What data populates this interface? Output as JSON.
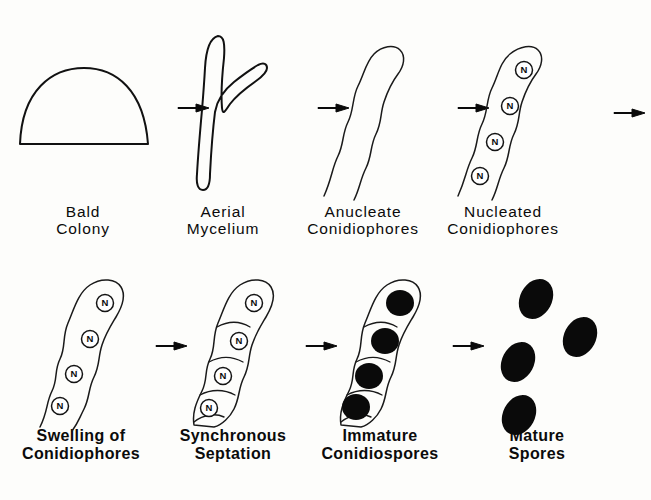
{
  "figure": {
    "background_color": "#fdfdfb",
    "ink_color": "#111111",
    "spore_fill_color": "#0a0a0a",
    "nucleus_label": "N"
  },
  "rows": [
    {
      "id": "row-top",
      "stages": [
        {
          "id": "bald-colony",
          "shape": "dome",
          "caption_lines": [
            "Bald",
            "Colony"
          ],
          "nuclei_count": 0,
          "septa_count": 0,
          "spores_count": 0
        },
        {
          "id": "aerial-mycelium",
          "shape": "branched-hypha",
          "caption_lines": [
            "Aerial",
            "Mycelium"
          ],
          "nuclei_count": 0,
          "septa_count": 0,
          "spores_count": 0
        },
        {
          "id": "anucleate-conidiophores",
          "shape": "wavy-tube",
          "caption_lines": [
            "Anucleate",
            "Conidiophores"
          ],
          "nuclei_count": 0,
          "septa_count": 0,
          "spores_count": 0
        },
        {
          "id": "nucleated-conidiophores",
          "shape": "wavy-tube-nuclei",
          "caption_lines": [
            "Nucleated",
            "Conidiophores"
          ],
          "nuclei_count": 4,
          "septa_count": 0,
          "spores_count": 0
        }
      ]
    },
    {
      "id": "row-bottom",
      "stages": [
        {
          "id": "swelling-of-conidiophores",
          "shape": "swollen-tube-nuclei",
          "caption_lines": [
            "Swelling of",
            "Conidiophores"
          ],
          "nuclei_count": 4,
          "septa_count": 0,
          "spores_count": 0
        },
        {
          "id": "synchronous-septation",
          "shape": "septate-tube-nuclei",
          "caption_lines": [
            "Synchronous",
            "Septation"
          ],
          "nuclei_count": 4,
          "septa_count": 4,
          "spores_count": 0
        },
        {
          "id": "immature-conidiospores",
          "shape": "septate-tube-spores",
          "caption_lines": [
            "Immature",
            "Conidiospores"
          ],
          "nuclei_count": 0,
          "septa_count": 4,
          "spores_count": 4
        },
        {
          "id": "mature-spores",
          "shape": "free-spores",
          "caption_lines": [
            "Mature",
            "Spores"
          ],
          "nuclei_count": 0,
          "septa_count": 0,
          "spores_count": 4
        }
      ]
    }
  ],
  "arrows": [
    {
      "id": "arrow-1",
      "from": "bald-colony",
      "to": "aerial-mycelium",
      "direction": "right"
    },
    {
      "id": "arrow-2",
      "from": "aerial-mycelium",
      "to": "anucleate-conidiophores",
      "direction": "right"
    },
    {
      "id": "arrow-3",
      "from": "anucleate-conidiophores",
      "to": "nucleated-conidiophores",
      "direction": "right"
    },
    {
      "id": "arrow-4",
      "from": "nucleated-conidiophores",
      "to": "swelling-of-conidiophores",
      "direction": "right"
    },
    {
      "id": "arrow-5",
      "from": "swelling-of-conidiophores",
      "to": "synchronous-septation",
      "direction": "right"
    },
    {
      "id": "arrow-6",
      "from": "synchronous-septation",
      "to": "immature-conidiospores",
      "direction": "right"
    },
    {
      "id": "arrow-7",
      "from": "immature-conidiospores",
      "to": "mature-spores",
      "direction": "right"
    }
  ]
}
